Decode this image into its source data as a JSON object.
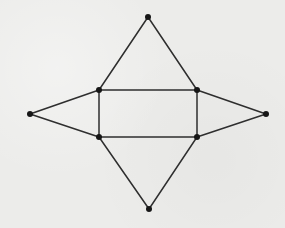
{
  "diagram": {
    "type": "pyramid-net",
    "colors": {
      "background": "#ececea",
      "line": "#2e2e2e",
      "vertex": "#161616"
    },
    "vertices": [
      {
        "id": "top-apex",
        "x": 148,
        "y": 17
      },
      {
        "id": "rect-top-left",
        "x": 99,
        "y": 90
      },
      {
        "id": "rect-top-right",
        "x": 197,
        "y": 90
      },
      {
        "id": "rect-bottom-left",
        "x": 99,
        "y": 137
      },
      {
        "id": "rect-bottom-right",
        "x": 197,
        "y": 137
      },
      {
        "id": "left-apex",
        "x": 30,
        "y": 114
      },
      {
        "id": "right-apex",
        "x": 266,
        "y": 114
      },
      {
        "id": "bottom-apex",
        "x": 149,
        "y": 209
      }
    ],
    "edges": [
      [
        "rect-top-left",
        "rect-top-right"
      ],
      [
        "rect-top-right",
        "rect-bottom-right"
      ],
      [
        "rect-bottom-right",
        "rect-bottom-left"
      ],
      [
        "rect-bottom-left",
        "rect-top-left"
      ],
      [
        "top-apex",
        "rect-top-left"
      ],
      [
        "top-apex",
        "rect-top-right"
      ],
      [
        "left-apex",
        "rect-top-left"
      ],
      [
        "left-apex",
        "rect-bottom-left"
      ],
      [
        "right-apex",
        "rect-top-right"
      ],
      [
        "right-apex",
        "rect-bottom-right"
      ],
      [
        "bottom-apex",
        "rect-bottom-left"
      ],
      [
        "bottom-apex",
        "rect-bottom-right"
      ]
    ]
  }
}
